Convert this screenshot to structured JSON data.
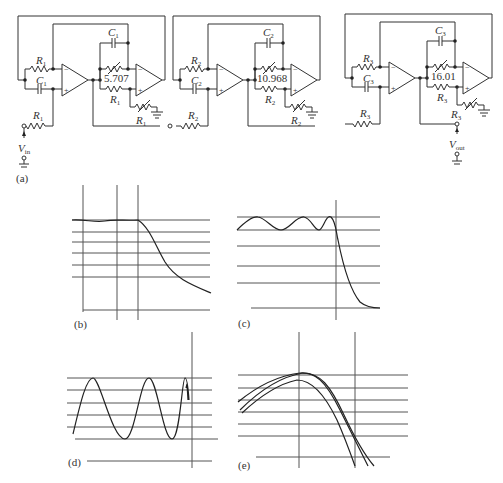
{
  "circuit": {
    "panel_label": "(a)",
    "input_label": "V",
    "input_sub": "in",
    "output_label": "V",
    "output_sub": "out",
    "stages": [
      {
        "r": "R",
        "r_sub": "1",
        "c": "C",
        "c_sub": "1",
        "gain": "5.707"
      },
      {
        "r": "R",
        "r_sub": "2",
        "c": "C",
        "c_sub": "2",
        "gain": "10.968"
      },
      {
        "r": "R",
        "r_sub": "3",
        "c": "C",
        "c_sub": "3",
        "gain": "16.01"
      }
    ]
  },
  "plots": {
    "b": {
      "label": "(b)",
      "description": "Flat passband then monotonic rolloff (Butterworth-like)"
    },
    "c": {
      "label": "(c)",
      "description": "Equiripple passband then steep rolloff (Chebyshev-like)"
    },
    "d": {
      "label": "(d)",
      "description": "Oscillatory response"
    },
    "e": {
      "label": "(e)",
      "description": "Three overlapping peaked curves"
    }
  }
}
